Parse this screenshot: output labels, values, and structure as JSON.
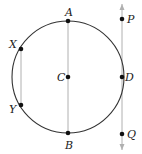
{
  "diagram": {
    "type": "geometry",
    "circle": {
      "center_label": "C",
      "cx": 68,
      "cy": 77,
      "r": 56,
      "stroke": "#333333"
    },
    "points": [
      {
        "label": "A",
        "x": 68,
        "y": 21,
        "label_dx": -3,
        "label_dy": -5
      },
      {
        "label": "B",
        "x": 68,
        "y": 133,
        "label_dx": -3,
        "label_dy": 16
      },
      {
        "label": "C",
        "x": 68,
        "y": 77,
        "label_dx": -11,
        "label_dy": 4
      },
      {
        "label": "D",
        "x": 122,
        "y": 77,
        "label_dx": 3,
        "label_dy": 4
      },
      {
        "label": "X",
        "x": 21,
        "y": 49,
        "label_dx": -12,
        "label_dy": -1
      },
      {
        "label": "Y",
        "x": 21,
        "y": 105,
        "label_dx": -12,
        "label_dy": 8
      },
      {
        "label": "P",
        "x": 122,
        "y": 19,
        "label_dx": 5,
        "label_dy": 4
      },
      {
        "label": "Q",
        "x": 122,
        "y": 134,
        "label_dx": 5,
        "label_dy": 4
      }
    ],
    "segments": [
      {
        "name": "diameter-AB",
        "from": "A",
        "to": "B",
        "stroke": "#b0b0b0"
      },
      {
        "name": "chord-XY",
        "from": "X",
        "to": "Y",
        "stroke": "#b0b0b0"
      }
    ],
    "lines": [
      {
        "name": "tangent-line-PQ",
        "x": 122,
        "y1": 4,
        "y2": 150,
        "stroke": "#b0b0b0",
        "arrows": "both"
      }
    ],
    "colors": {
      "point": "#111111",
      "circle": "#333333",
      "line": "#b0b0b0",
      "label": "#222222"
    }
  }
}
